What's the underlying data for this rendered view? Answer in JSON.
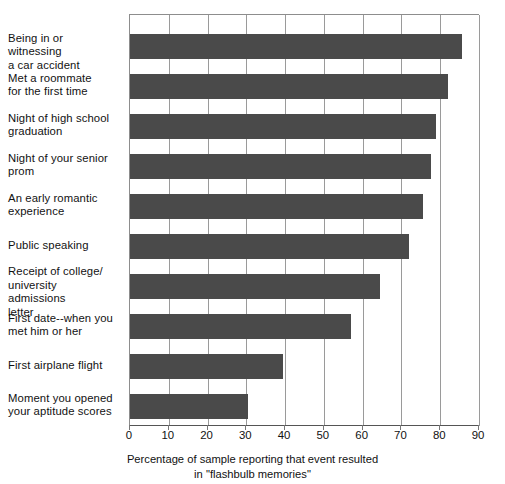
{
  "chart_data": {
    "type": "bar",
    "orientation": "horizontal",
    "title": "",
    "subtitle": "",
    "xlabel_lines": [
      "Percentage of sample reporting that event resulted",
      "in \"flashbulb memories\""
    ],
    "ylabel": "",
    "xlim": [
      0,
      90
    ],
    "xticks": [
      0,
      10,
      20,
      30,
      40,
      50,
      60,
      70,
      80,
      90
    ],
    "xtick_labels": [
      "0",
      "10",
      "20",
      "30",
      "40",
      "50",
      "60",
      "70",
      "80",
      "90"
    ],
    "grid": "vertical",
    "legend": "none",
    "bar_color": "#4a4a4a",
    "categories": [
      "Being in or witnessing a car accident",
      "Met a roommate for the first time",
      "Night of high school graduation",
      "Night of your senior prom",
      "An early romantic experience",
      "Public speaking",
      "Receipt of college/university admissions letter",
      "First date--when you met him or her",
      "First airplane flight",
      "Moment you opened your aptitude scores"
    ],
    "category_label_lines": [
      [
        "Being in or witnessing",
        "a car accident"
      ],
      [
        "Met a roommate",
        "for the first time"
      ],
      [
        "Night of high school",
        "graduation"
      ],
      [
        "Night of your senior",
        "prom"
      ],
      [
        "An early romantic",
        "experience"
      ],
      [
        "Public speaking"
      ],
      [
        "Receipt of college/",
        "university admissions",
        "letter"
      ],
      [
        "First date--when you",
        "met him or her"
      ],
      [
        "First airplane flight"
      ],
      [
        "Moment you opened",
        "your aptitude scores"
      ]
    ],
    "values": [
      85.5,
      82,
      79,
      77.5,
      75.5,
      72,
      64.5,
      57,
      39.5,
      30.5
    ]
  }
}
